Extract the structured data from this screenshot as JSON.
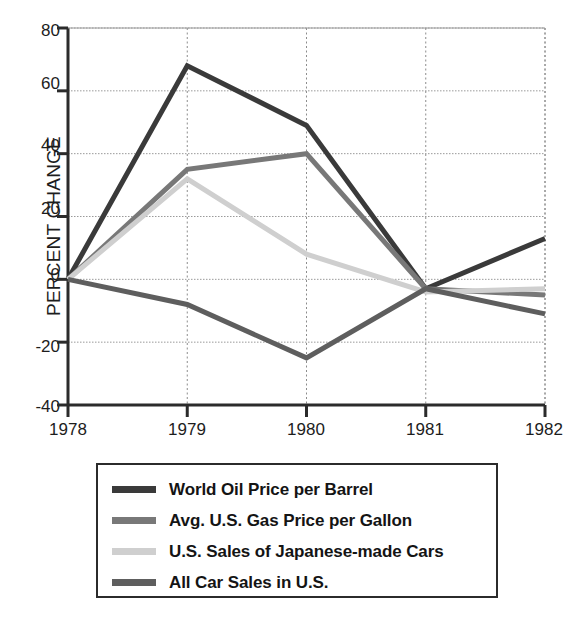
{
  "chart_data": {
    "type": "line",
    "title": "",
    "title_note": "chart title is cropped off the top edge of the screenshot",
    "xlabel": "",
    "ylabel": "PERCENT CHANGE",
    "x": [
      1978,
      1979,
      1980,
      1981,
      1982
    ],
    "xticklabels": [
      "1978",
      "1979",
      "1980",
      "1981",
      "1982"
    ],
    "yticklabels": [
      "80",
      "60",
      "40",
      "20",
      "0",
      "-20",
      "-40"
    ],
    "yticks": [
      80,
      60,
      40,
      20,
      0,
      -20,
      -40
    ],
    "ylim": [
      -40,
      80
    ],
    "xlim": [
      1978,
      1982
    ],
    "grid": "dotted horizontal and vertical gridlines",
    "legend_position": "below plot, bordered box",
    "series": [
      {
        "name": "World Oil Price per Barrel",
        "color": "#3a3a3a",
        "values": [
          0,
          68,
          49,
          -3,
          13
        ]
      },
      {
        "name": "Avg. U.S. Gas Price per Gallon",
        "color": "#787878",
        "values": [
          0,
          35,
          40,
          -3,
          -5
        ]
      },
      {
        "name": "U.S. Sales of Japanese-made Cars",
        "color": "#cfcfcf",
        "values": [
          0,
          32,
          8,
          -4,
          -3
        ]
      },
      {
        "name": "All Car Sales in U.S.",
        "color": "#5e5e5e",
        "values": [
          0,
          -8,
          -25,
          -3,
          -11
        ]
      }
    ]
  },
  "axis": {
    "ylabel": "PERCENT CHANGE"
  },
  "legend": {
    "items": [
      {
        "label": "World Oil Price per Barrel"
      },
      {
        "label": "Avg. U.S. Gas Price per Gallon"
      },
      {
        "label": "U.S. Sales of Japanese-made Cars"
      },
      {
        "label": "All Car Sales in U.S."
      }
    ]
  }
}
